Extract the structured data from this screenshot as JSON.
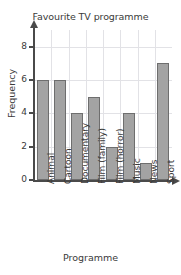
{
  "chart_data": {
    "type": "bar",
    "title": "Favourite TV programme",
    "xlabel": "Programme",
    "ylabel": "Frequency",
    "categories": [
      "Animal",
      "Cartoon",
      "Documentary",
      "Film (family)",
      "Film (horror)",
      "Music",
      "News",
      "Sport"
    ],
    "values": [
      6,
      6,
      4,
      5,
      2,
      4,
      1,
      7
    ],
    "ylim": [
      0,
      9
    ],
    "yticks": [
      0,
      2,
      4,
      6,
      8
    ],
    "ytick_labels": [
      "0",
      "2",
      "4",
      "6",
      "8"
    ],
    "grid": true,
    "legend": false,
    "bar_color": "#a3a3a3",
    "bar_edge_color": "#6e6e6e",
    "axis_color": "#4a4a4a",
    "grid_color": "#e2e2e6",
    "background_color": "#ffffff"
  }
}
